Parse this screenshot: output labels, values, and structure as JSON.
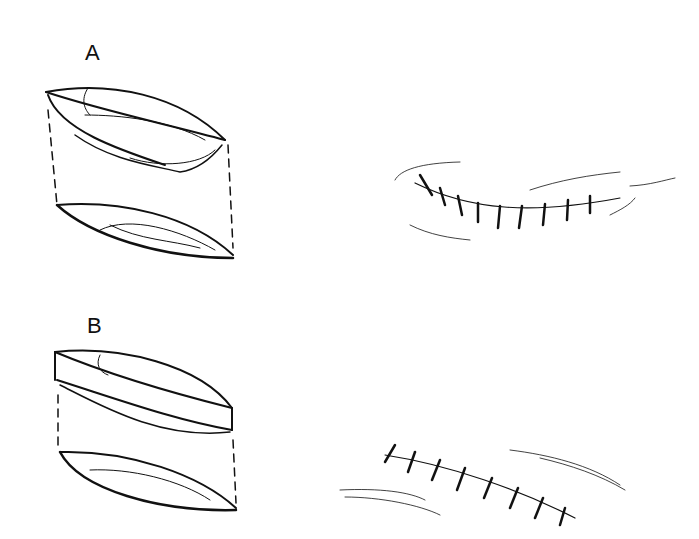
{
  "figure": {
    "panels": [
      {
        "label": "A",
        "left_drawing": "excised lens-shaped wound segment with separated upper and lower halves connected by dashed lines",
        "right_drawing": "curved closed incision with interrupted sutures"
      },
      {
        "label": "B",
        "left_drawing": "excised lens-shaped wound segment with thicker upper slab and lower half connected by dashed lines",
        "right_drawing": "straight closed incision with interrupted sutures"
      }
    ],
    "colors": {
      "ink": "#111111",
      "background": "#ffffff"
    }
  }
}
